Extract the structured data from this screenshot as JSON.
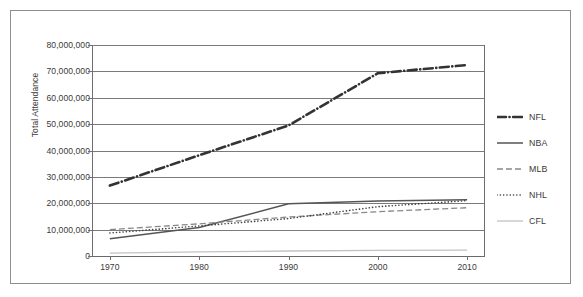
{
  "chart_data": {
    "type": "line",
    "title": "",
    "xlabel": "",
    "ylabel": "Total Attendance",
    "x": [
      1970,
      1980,
      1990,
      2000,
      2010
    ],
    "xlim": [
      1968,
      2012
    ],
    "ylim": [
      0,
      80000000
    ],
    "ytick_labels": [
      "0",
      "10,000,000",
      "20,000,000",
      "30,000,000",
      "40,000,000",
      "50,000,000",
      "60,000,000",
      "70,000,000",
      "80,000,000"
    ],
    "ytick_values": [
      0,
      10000000,
      20000000,
      30000000,
      40000000,
      50000000,
      60000000,
      70000000,
      80000000
    ],
    "xtick_labels": [
      "1970",
      "1980",
      "1990",
      "2000",
      "2010"
    ],
    "grid": true,
    "legend_position": "right",
    "series": [
      {
        "name": "NFL",
        "style": "dash-dot",
        "color": "#333333",
        "width": 2.6,
        "values": [
          26700000,
          38200000,
          49500000,
          69300000,
          72400000
        ]
      },
      {
        "name": "NBA",
        "style": "solid",
        "color": "#555555",
        "width": 1.5,
        "values": [
          6500000,
          10800000,
          19800000,
          20900000,
          21300000
        ]
      },
      {
        "name": "MLB",
        "style": "dashed",
        "color": "#888888",
        "width": 1.3,
        "values": [
          10000000,
          12200000,
          14800000,
          16800000,
          18300000
        ]
      },
      {
        "name": "NHL",
        "style": "dotted",
        "color": "#444444",
        "width": 1.6,
        "values": [
          8700000,
          11400000,
          14200000,
          18700000,
          21000000
        ]
      },
      {
        "name": "CFL",
        "style": "solid",
        "color": "#c2c2c2",
        "width": 1.3,
        "values": [
          1100000,
          1600000,
          1900000,
          2100000,
          2200000
        ]
      }
    ]
  },
  "legend": {
    "items": [
      {
        "label": "NFL"
      },
      {
        "label": "NBA"
      },
      {
        "label": "MLB"
      },
      {
        "label": "NHL"
      },
      {
        "label": "CFL"
      }
    ]
  },
  "colors": {
    "frame": "#8e8e8e",
    "grid": "#7a7a7a",
    "text": "#3a3a3a",
    "background": "#ffffff"
  }
}
